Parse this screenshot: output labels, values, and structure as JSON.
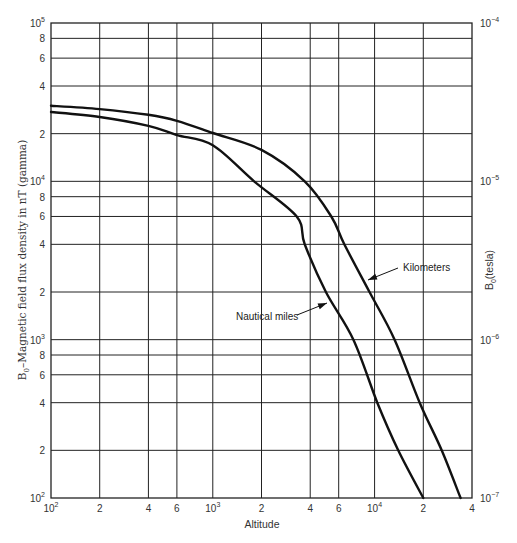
{
  "chart_data": {
    "type": "line",
    "title": "",
    "xlabel": "Altitude",
    "ylabel": "B0 – Magnetic field flux density in nT (gamma)",
    "ylabel_right": "B0(tesla)",
    "xscale": "log",
    "yscale": "log",
    "xlim": [
      100,
      40000
    ],
    "ylim": [
      100,
      100000
    ],
    "ylim_right": [
      1e-07,
      0.0001
    ],
    "grid": true,
    "legend": "inline annotations with arrows",
    "x_ticks": [
      {
        "value": 100,
        "label": "10",
        "sup": "2"
      },
      {
        "value": 200,
        "label": "2",
        "sup": ""
      },
      {
        "value": 400,
        "label": "4",
        "sup": ""
      },
      {
        "value": 600,
        "label": "6",
        "sup": ""
      },
      {
        "value": 1000,
        "label": "10",
        "sup": "3"
      },
      {
        "value": 2000,
        "label": "2",
        "sup": ""
      },
      {
        "value": 4000,
        "label": "4",
        "sup": ""
      },
      {
        "value": 6000,
        "label": "6",
        "sup": ""
      },
      {
        "value": 10000,
        "label": "10",
        "sup": "4"
      },
      {
        "value": 20000,
        "label": "2",
        "sup": ""
      },
      {
        "value": 40000,
        "label": "4",
        "sup": ""
      }
    ],
    "y_ticks": [
      {
        "value": 100,
        "label": "10",
        "sup": "2"
      },
      {
        "value": 200,
        "label": "2",
        "sup": ""
      },
      {
        "value": 400,
        "label": "4",
        "sup": ""
      },
      {
        "value": 600,
        "label": "6",
        "sup": ""
      },
      {
        "value": 800,
        "label": "8",
        "sup": ""
      },
      {
        "value": 1000,
        "label": "10",
        "sup": "3"
      },
      {
        "value": 2000,
        "label": "2",
        "sup": ""
      },
      {
        "value": 4000,
        "label": "4",
        "sup": ""
      },
      {
        "value": 6000,
        "label": "6",
        "sup": ""
      },
      {
        "value": 8000,
        "label": "8",
        "sup": ""
      },
      {
        "value": 10000,
        "label": "10",
        "sup": "4"
      },
      {
        "value": 20000,
        "label": "2",
        "sup": ""
      },
      {
        "value": 40000,
        "label": "4",
        "sup": ""
      },
      {
        "value": 60000,
        "label": "6",
        "sup": ""
      },
      {
        "value": 80000,
        "label": "8",
        "sup": ""
      },
      {
        "value": 100000,
        "label": "10",
        "sup": "5"
      }
    ],
    "y_ticks_right": [
      {
        "value": 0.0001,
        "label": "10",
        "sup": "−4"
      },
      {
        "value": 1e-05,
        "label": "10",
        "sup": "−5"
      },
      {
        "value": 1e-06,
        "label": "10",
        "sup": "−6"
      },
      {
        "value": 1e-07,
        "label": "10",
        "sup": "−7"
      }
    ],
    "series": [
      {
        "name": "Kilometers",
        "x": [
          100,
          200,
          400,
          600,
          1000,
          2000,
          3700,
          5400,
          6500,
          9300,
          13300,
          19000,
          26000,
          34000
        ],
        "y": [
          30000,
          28600,
          26300,
          24100,
          20200,
          15800,
          10000,
          6000,
          4000,
          2000,
          1000,
          400,
          200,
          100
        ]
      },
      {
        "name": "Nautical miles",
        "x": [
          100,
          200,
          400,
          600,
          1000,
          1800,
          3300,
          3700,
          5000,
          7400,
          10400,
          14000,
          20000
        ],
        "y": [
          27400,
          25500,
          22400,
          19600,
          16900,
          10000,
          6000,
          4000,
          2000,
          1000,
          400,
          200,
          100
        ]
      }
    ],
    "annotations": [
      {
        "text": "Kilometers",
        "series": "Kilometers",
        "text_pos": [
          403,
          271
        ],
        "arrow_from": [
          398,
          268
        ],
        "arrow_to": [
          368,
          280
        ]
      },
      {
        "text": "Nautical miles",
        "series": "Nautical miles",
        "text_pos": [
          236,
          320
        ],
        "arrow_from": [
          297,
          315
        ],
        "arrow_to": [
          327,
          303
        ]
      }
    ]
  },
  "labels": {
    "x_axis_title": "Altitude",
    "y_axis_title_main": "B",
    "y_axis_title_sub": "0",
    "y_axis_title_rest": "–Magnetic field flux density in nT (gamma)",
    "y2_axis_title_main": "B",
    "y2_axis_title_sub": "0",
    "y2_axis_title_rest": "(tesla)"
  }
}
